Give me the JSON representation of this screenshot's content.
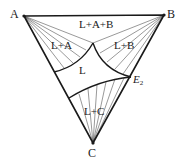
{
  "diagram": {
    "type": "ternary-phase-diagram",
    "vertices": {
      "A": {
        "label": "A"
      },
      "B": {
        "label": "B"
      },
      "C": {
        "label": "C"
      }
    },
    "regions": {
      "l_a_b": {
        "label": "L+A+B"
      },
      "l_a": {
        "label": "L+A"
      },
      "l_b": {
        "label": "L+B"
      },
      "l": {
        "label": "L"
      },
      "l_c": {
        "label": "L+C"
      }
    },
    "points": {
      "e2": {
        "label": "E",
        "subscript": "2"
      }
    },
    "colors": {
      "line": "#1a1a1a",
      "background": "#ffffff"
    }
  }
}
